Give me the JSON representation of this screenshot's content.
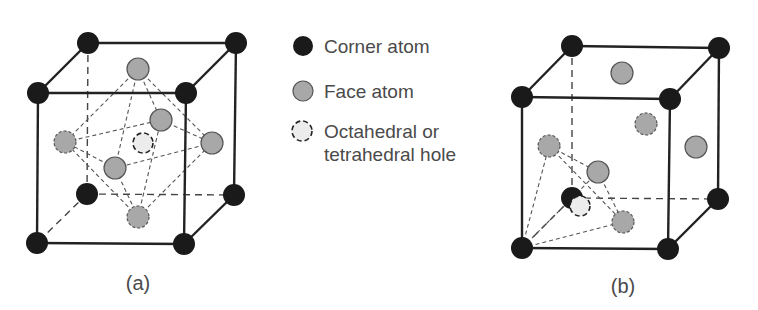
{
  "legend": {
    "items": [
      {
        "key": "corner",
        "label": "Corner atom",
        "symbol": "filled-dark-circle"
      },
      {
        "key": "face",
        "label": "Face atom",
        "symbol": "filled-gray-circle"
      },
      {
        "key": "hole",
        "label_line1": "Octahedral or",
        "label_line2": "tetrahedral hole",
        "symbol": "dashed-light-circle"
      }
    ]
  },
  "figures": [
    {
      "id": "a",
      "caption": "(a)",
      "description": "FCC unit cell with octahedral hole at body center, octahedron formed by six face atoms"
    },
    {
      "id": "b",
      "caption": "(b)",
      "description": "FCC unit cell with tetrahedral hole near corner, tetrahedron formed by one corner atom and three face atoms"
    }
  ],
  "colors": {
    "corner": "#1a1a1a",
    "face": "#a8a8a8",
    "hole": "#ececec",
    "edge": "#222222",
    "dashed": "#555555",
    "text": "#4a4a4a"
  }
}
